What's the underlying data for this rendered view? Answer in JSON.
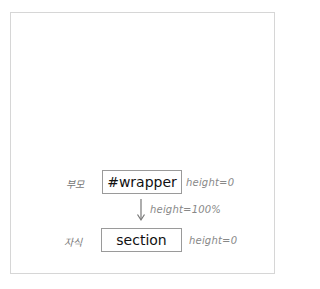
{
  "diagram": {
    "parent": {
      "role_label": "부모",
      "name": "#wrapper",
      "note": "height=0"
    },
    "relation": {
      "note": "height=100%",
      "direction": "down"
    },
    "child": {
      "role_label": "자식",
      "name": "section",
      "note": "height=0"
    }
  },
  "colors": {
    "box_border": "#9a9a9a",
    "frame_border": "#d6d6d6",
    "note_text": "#888888",
    "arrow": "#777777"
  }
}
